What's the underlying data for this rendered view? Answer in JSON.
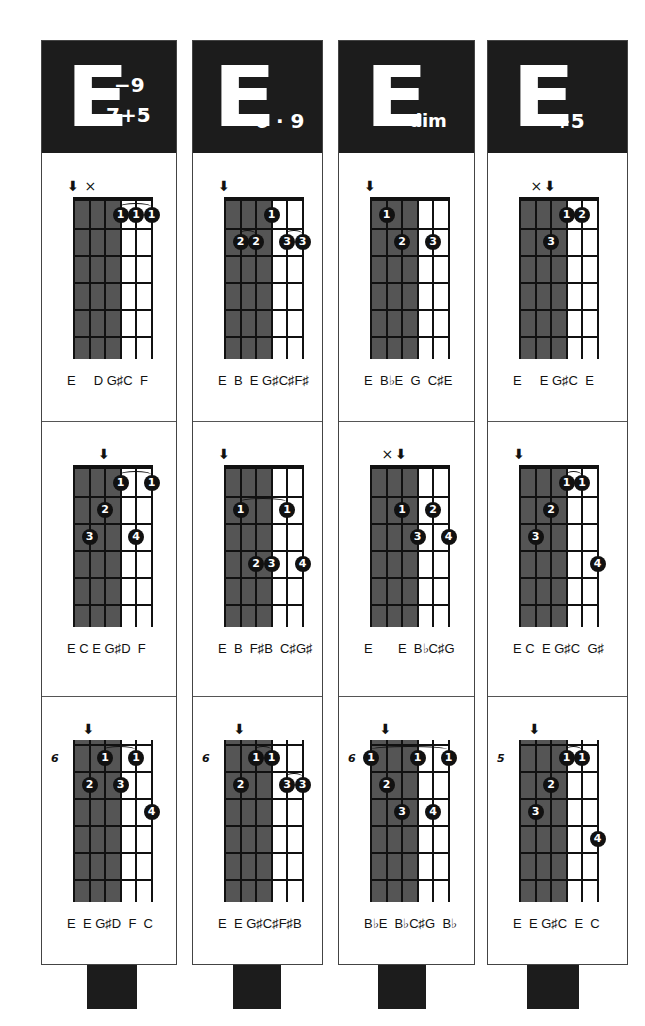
{
  "colors": {
    "header_bg": "#1c1c1c",
    "shade": "#555555",
    "ink": "#111111"
  },
  "columns": [
    {
      "chord": {
        "root": "E",
        "superscript": "−9",
        "subscript": "7+5"
      },
      "diagrams": [
        {
          "fret_label": "",
          "root_arrow_string": 1,
          "muted_strings": [
            2
          ],
          "shade": true,
          "dots": [
            {
              "string": 4,
              "fret": 1,
              "finger": "1"
            },
            {
              "string": 5,
              "fret": 1,
              "finger": "1"
            },
            {
              "string": 6,
              "fret": 1,
              "finger": "1"
            }
          ],
          "barres": [
            {
              "from": 4,
              "to": 6,
              "fret": 1
            }
          ],
          "notes": "E     D G♯C  F"
        },
        {
          "fret_label": "",
          "root_arrow_string": 3,
          "muted_strings": [],
          "shade": true,
          "dots": [
            {
              "string": 4,
              "fret": 1,
              "finger": "1"
            },
            {
              "string": 6,
              "fret": 1,
              "finger": "1"
            },
            {
              "string": 3,
              "fret": 2,
              "finger": "2"
            },
            {
              "string": 2,
              "fret": 3,
              "finger": "3"
            },
            {
              "string": 5,
              "fret": 3,
              "finger": "4"
            }
          ],
          "barres": [
            {
              "from": 4,
              "to": 6,
              "fret": 1
            }
          ],
          "notes": "E C E G♯D  F"
        },
        {
          "fret_label": "6",
          "root_arrow_string": 2,
          "muted_strings": [],
          "shade": true,
          "dots": [
            {
              "string": 3,
              "fret": 1,
              "finger": "1"
            },
            {
              "string": 5,
              "fret": 1,
              "finger": "1"
            },
            {
              "string": 2,
              "fret": 2,
              "finger": "2"
            },
            {
              "string": 4,
              "fret": 2,
              "finger": "3"
            },
            {
              "string": 6,
              "fret": 3,
              "finger": "4"
            }
          ],
          "barres": [
            {
              "from": 3,
              "to": 5,
              "fret": 1
            }
          ],
          "notes": "E  E G♯D  F  C"
        }
      ]
    },
    {
      "chord": {
        "root": "E",
        "superscript": "",
        "subscript": "6 · 9"
      },
      "diagrams": [
        {
          "fret_label": "",
          "root_arrow_string": 1,
          "muted_strings": [],
          "shade": true,
          "dots": [
            {
              "string": 4,
              "fret": 1,
              "finger": "1"
            },
            {
              "string": 2,
              "fret": 2,
              "finger": "2"
            },
            {
              "string": 3,
              "fret": 2,
              "finger": "2"
            },
            {
              "string": 5,
              "fret": 2,
              "finger": "3"
            },
            {
              "string": 6,
              "fret": 2,
              "finger": "3"
            }
          ],
          "barres": [
            {
              "from": 2,
              "to": 3,
              "fret": 2
            },
            {
              "from": 5,
              "to": 6,
              "fret": 2
            }
          ],
          "notes": "E  B  E G♯C♯F♯"
        },
        {
          "fret_label": "",
          "root_arrow_string": 1,
          "muted_strings": [],
          "shade": true,
          "dots": [
            {
              "string": 2,
              "fret": 2,
              "finger": "1"
            },
            {
              "string": 5,
              "fret": 2,
              "finger": "1"
            },
            {
              "string": 3,
              "fret": 4,
              "finger": "2"
            },
            {
              "string": 4,
              "fret": 4,
              "finger": "3"
            },
            {
              "string": 6,
              "fret": 4,
              "finger": "4"
            }
          ],
          "barres": [
            {
              "from": 2,
              "to": 5,
              "fret": 2
            }
          ],
          "notes": "E  B  F♯B  C♯G♯"
        },
        {
          "fret_label": "6",
          "root_arrow_string": 2,
          "muted_strings": [],
          "shade": true,
          "dots": [
            {
              "string": 3,
              "fret": 1,
              "finger": "1"
            },
            {
              "string": 4,
              "fret": 1,
              "finger": "1"
            },
            {
              "string": 2,
              "fret": 2,
              "finger": "2"
            },
            {
              "string": 5,
              "fret": 2,
              "finger": "3"
            },
            {
              "string": 6,
              "fret": 2,
              "finger": "3"
            }
          ],
          "barres": [
            {
              "from": 3,
              "to": 4,
              "fret": 1
            },
            {
              "from": 5,
              "to": 6,
              "fret": 2
            }
          ],
          "notes": "E  E G♯C♯F♯B"
        }
      ]
    },
    {
      "chord": {
        "root": "E",
        "superscript": "",
        "subscript": "dim"
      },
      "diagrams": [
        {
          "fret_label": "",
          "root_arrow_string": 1,
          "muted_strings": [],
          "shade": true,
          "dots": [
            {
              "string": 2,
              "fret": 1,
              "finger": "1"
            },
            {
              "string": 3,
              "fret": 2,
              "finger": "2"
            },
            {
              "string": 5,
              "fret": 2,
              "finger": "3"
            }
          ],
          "barres": [],
          "notes": "E  B♭E  G  C♯E"
        },
        {
          "fret_label": "",
          "root_arrow_string": 3,
          "muted_strings": [
            2
          ],
          "shade": true,
          "dots": [
            {
              "string": 3,
              "fret": 2,
              "finger": "1"
            },
            {
              "string": 5,
              "fret": 2,
              "finger": "2"
            },
            {
              "string": 4,
              "fret": 3,
              "finger": "3"
            },
            {
              "string": 6,
              "fret": 3,
              "finger": "4"
            }
          ],
          "barres": [],
          "notes": "E       E  B♭C♯G"
        },
        {
          "fret_label": "6",
          "root_arrow_string": 2,
          "muted_strings": [],
          "shade": true,
          "dots": [
            {
              "string": 1,
              "fret": 1,
              "finger": "1"
            },
            {
              "string": 4,
              "fret": 1,
              "finger": "1"
            },
            {
              "string": 6,
              "fret": 1,
              "finger": "1"
            },
            {
              "string": 2,
              "fret": 2,
              "finger": "2"
            },
            {
              "string": 3,
              "fret": 3,
              "finger": "3"
            },
            {
              "string": 5,
              "fret": 3,
              "finger": "4"
            }
          ],
          "barres": [
            {
              "from": 1,
              "to": 6,
              "fret": 1
            }
          ],
          "notes": "B♭E  B♭C♯G  B♭"
        }
      ]
    },
    {
      "chord": {
        "root": "E",
        "superscript": "",
        "subscript": "+5"
      },
      "diagrams": [
        {
          "fret_label": "",
          "root_arrow_string": 3,
          "muted_strings": [
            2
          ],
          "shade": true,
          "dots": [
            {
              "string": 4,
              "fret": 1,
              "finger": "1"
            },
            {
              "string": 5,
              "fret": 1,
              "finger": "2"
            },
            {
              "string": 3,
              "fret": 2,
              "finger": "3"
            }
          ],
          "barres": [],
          "notes": "E     E G♯C  E"
        },
        {
          "fret_label": "",
          "root_arrow_string": 1,
          "muted_strings": [],
          "shade": true,
          "dots": [
            {
              "string": 4,
              "fret": 1,
              "finger": "1"
            },
            {
              "string": 5,
              "fret": 1,
              "finger": "1"
            },
            {
              "string": 3,
              "fret": 2,
              "finger": "2"
            },
            {
              "string": 2,
              "fret": 3,
              "finger": "3"
            },
            {
              "string": 6,
              "fret": 4,
              "finger": "4"
            }
          ],
          "barres": [
            {
              "from": 4,
              "to": 5,
              "fret": 1
            }
          ],
          "notes": "E C  E G♯C  G♯"
        },
        {
          "fret_label": "5",
          "root_arrow_string": 2,
          "muted_strings": [],
          "shade": true,
          "dots": [
            {
              "string": 4,
              "fret": 1,
              "finger": "1"
            },
            {
              "string": 5,
              "fret": 1,
              "finger": "1"
            },
            {
              "string": 3,
              "fret": 2,
              "finger": "2"
            },
            {
              "string": 2,
              "fret": 3,
              "finger": "3"
            },
            {
              "string": 6,
              "fret": 4,
              "finger": "4"
            }
          ],
          "barres": [
            {
              "from": 4,
              "to": 5,
              "fret": 1
            }
          ],
          "notes": "E  E G♯C  E  C"
        }
      ]
    }
  ],
  "glyphs": {
    "root_arrow": "🢃",
    "mute": "×"
  }
}
